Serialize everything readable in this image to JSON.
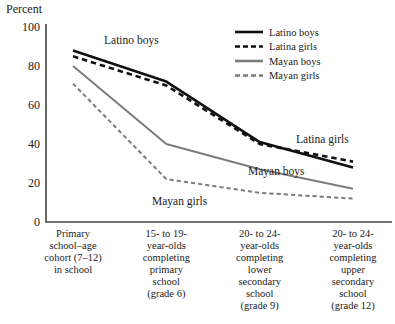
{
  "chart_data": {
    "type": "line",
    "title": "",
    "ylabel": "Percent",
    "xlabel": "",
    "ylim": [
      0,
      100
    ],
    "yticks": [
      0,
      20,
      40,
      60,
      80,
      100
    ],
    "grid": false,
    "legend_position": "top-right",
    "categories": [
      "Primary school–age cohort (7–12) in school",
      "15- to 19-year-olds completing primary school (grade 6)",
      "20- to 24-year-olds completing lower secondary school (grade 9)",
      "20- to 24-year-olds completing upper secondary school (grade 12)"
    ],
    "category_label_lines": [
      [
        "Primary",
        "school–age",
        "cohort (7–12)",
        "in school"
      ],
      [
        "15- to 19-",
        "year-olds",
        "completing",
        "primary",
        "school",
        "(grade 6)"
      ],
      [
        "20- to 24-",
        "year-olds",
        "completing",
        "lower",
        "secondary",
        "school",
        "(grade 9)"
      ],
      [
        "20- to 24-",
        "year-olds",
        "completing",
        "upper",
        "secondary",
        "school",
        "(grade 12)"
      ]
    ],
    "series": [
      {
        "name": "Latino boys",
        "values": [
          88,
          72,
          41,
          28
        ],
        "color": "#111111",
        "style": "solid",
        "width": 2.6
      },
      {
        "name": "Latina girls",
        "values": [
          85,
          70,
          40,
          31
        ],
        "color": "#111111",
        "style": "dashed",
        "width": 2.6
      },
      {
        "name": "Mayan boys",
        "values": [
          80,
          40,
          27,
          17
        ],
        "color": "#7c7c7c",
        "style": "solid",
        "width": 2.0
      },
      {
        "name": "Mayan girls",
        "values": [
          71,
          22,
          15,
          12
        ],
        "color": "#7c7c7c",
        "style": "dashed",
        "width": 2.0
      }
    ],
    "annotations": [
      {
        "text": "Latino boys",
        "x": 104,
        "y": 44
      },
      {
        "text": "Latina girls",
        "x": 296,
        "y": 143
      },
      {
        "text": "Mayan boys",
        "x": 248,
        "y": 175
      },
      {
        "text": "Mayan girls",
        "x": 152,
        "y": 205
      }
    ],
    "legend": [
      {
        "label": "Latino boys",
        "color": "#111111",
        "style": "solid"
      },
      {
        "label": "Latina girls",
        "color": "#111111",
        "style": "dashed"
      },
      {
        "label": "Mayan boys",
        "color": "#7c7c7c",
        "style": "solid"
      },
      {
        "label": "Mayan girls",
        "color": "#7c7c7c",
        "style": "dashed"
      }
    ]
  },
  "axis": {
    "y_title": "Percent",
    "tick_100": "100",
    "tick_80": "80",
    "tick_60": "60",
    "tick_40": "40",
    "tick_20": "20",
    "tick_0": "0"
  }
}
